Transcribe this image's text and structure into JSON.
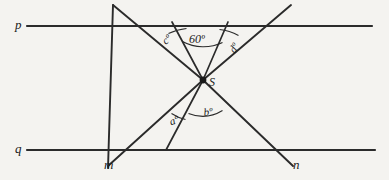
{
  "figure": {
    "background_color": "#f4f3f0",
    "stroke_color": "#2b2b2b"
  },
  "lines": {
    "p_label": "p",
    "q_label": "q",
    "m_label": "m",
    "n_label": "n"
  },
  "vertex": {
    "label": "S"
  },
  "angles": {
    "c": "cº",
    "sixty": "60º",
    "d": "dº",
    "a": "aº",
    "b": "bº"
  }
}
